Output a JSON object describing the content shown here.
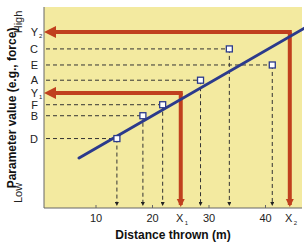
{
  "chart_data": {
    "type": "scatter",
    "title": "",
    "xlabel": "Distance thrown (m)",
    "ylabel": "Parameter value (e.g., force)",
    "y_low_label": "Low",
    "y_high_label": "High",
    "xlim": [
      2.5,
      48
    ],
    "ylim": [
      0,
      100
    ],
    "x_ticks": [
      10,
      20,
      30,
      40
    ],
    "x_special_ticks": [
      {
        "label": "X",
        "sub": "1",
        "x": 25
      },
      {
        "label": "X",
        "sub": "2",
        "x": 44.3
      }
    ],
    "points": [
      {
        "label": "D",
        "x": 13.7,
        "y": 24.5
      },
      {
        "label": "B",
        "x": 18.3,
        "y": 38
      },
      {
        "label": "F",
        "x": 21.8,
        "y": 44.5
      },
      {
        "label": "A",
        "x": 28.5,
        "y": 59
      },
      {
        "label": "C",
        "x": 33.6,
        "y": 77.5
      },
      {
        "label": "E",
        "x": 41.2,
        "y": 68
      }
    ],
    "y_special": [
      {
        "label": "Y",
        "sub": "1",
        "y": 51.5,
        "x": 25
      },
      {
        "label": "Y",
        "sub": "2",
        "y": 87.5,
        "x": 44.3
      }
    ],
    "regression_line": {
      "x_start": 7,
      "y_start": 13,
      "x_end": 47,
      "y_end": 90
    },
    "colors": {
      "background": "#f3eaa0",
      "line": "#2b3a8c",
      "arrows": "#c0401e",
      "dashed": "#333333"
    },
    "grid": false,
    "legend": "none"
  }
}
